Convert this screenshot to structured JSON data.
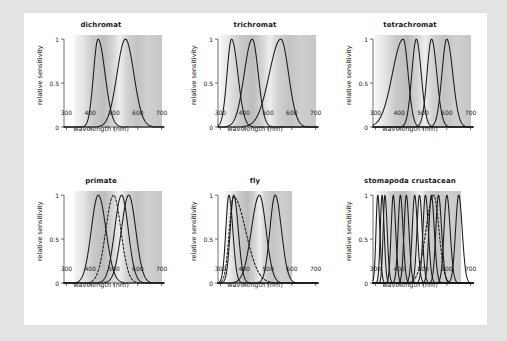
{
  "figure": {
    "background_color": "#e3e3e3",
    "page_color": "#ffffff",
    "axis_label_x": "wavelength (nm)",
    "axis_label_y": "relative sensitivity",
    "x_ticks": [
      "300",
      "400",
      "500",
      "600",
      "700"
    ],
    "y_ticks": [
      "0",
      "0.5",
      "1"
    ]
  },
  "chart_data": [
    {
      "type": "line",
      "title": "dichromat",
      "xlabel": "wavelength (nm)",
      "ylabel": "relative sensitivity",
      "xlim": [
        290,
        710
      ],
      "ylim": [
        0,
        1.05
      ],
      "xticks": [
        300,
        400,
        500,
        600,
        700
      ],
      "yticks": [
        0,
        0.5,
        1
      ],
      "grid": false,
      "legend": "none",
      "spectrum_start_nm": 330,
      "spectrum_end_nm": 700,
      "series": [
        {
          "name": "S-cone",
          "peak_nm": 433,
          "width_left_nm": 26,
          "width_right_nm": 40,
          "values_note": "gaussian peak 1.0",
          "dashed": false
        },
        {
          "name": "L-cone",
          "peak_nm": 548,
          "width_left_nm": 48,
          "width_right_nm": 48,
          "values_note": "gaussian peak 1.0",
          "dashed": false
        }
      ]
    },
    {
      "type": "line",
      "title": "trichromat",
      "xlabel": "wavelength (nm)",
      "ylabel": "relative sensitivity",
      "xlim": [
        290,
        710
      ],
      "ylim": [
        0,
        1.05
      ],
      "xticks": [
        300,
        400,
        500,
        600,
        700
      ],
      "yticks": [
        0,
        0.5,
        1
      ],
      "grid": false,
      "legend": "none",
      "spectrum_start_nm": 300,
      "spectrum_end_nm": 700,
      "series": [
        {
          "name": "UV",
          "peak_nm": 347,
          "width_left_nm": 26,
          "width_right_nm": 36,
          "dashed": false
        },
        {
          "name": "S",
          "peak_nm": 434,
          "width_left_nm": 46,
          "width_right_nm": 34,
          "dashed": false
        },
        {
          "name": "L",
          "peak_nm": 554,
          "width_left_nm": 66,
          "width_right_nm": 44,
          "dashed": false
        }
      ]
    },
    {
      "type": "line",
      "title": "tetrachromat",
      "xlabel": "wavelength (nm)",
      "ylabel": "relative sensitivity",
      "xlim": [
        290,
        710
      ],
      "ylim": [
        0,
        1.05
      ],
      "xticks": [
        300,
        400,
        500,
        600,
        700
      ],
      "yticks": [
        0,
        0.5,
        1
      ],
      "grid": false,
      "legend": "none",
      "spectrum_start_nm": 300,
      "spectrum_end_nm": 700,
      "series": [
        {
          "name": "P1",
          "peak_nm": 417,
          "width_left_nm": 62,
          "width_right_nm": 28,
          "dashed": false
        },
        {
          "name": "P2",
          "peak_nm": 472,
          "width_left_nm": 26,
          "width_right_nm": 28,
          "dashed": false
        },
        {
          "name": "P3",
          "peak_nm": 536,
          "width_left_nm": 26,
          "width_right_nm": 30,
          "dashed": false
        },
        {
          "name": "P4",
          "peak_nm": 600,
          "width_left_nm": 28,
          "width_right_nm": 34,
          "dashed": false
        }
      ]
    },
    {
      "type": "line",
      "title": "primate",
      "xlabel": "wavelength (nm)",
      "ylabel": "relative sensitivity",
      "xlim": [
        290,
        710
      ],
      "ylim": [
        0,
        1.05
      ],
      "xticks": [
        300,
        400,
        500,
        600,
        700
      ],
      "yticks": [
        0,
        0.5,
        1
      ],
      "grid": false,
      "legend": "none",
      "spectrum_start_nm": 330,
      "spectrum_end_nm": 700,
      "series": [
        {
          "name": "S-cone",
          "peak_nm": 434,
          "width_left_nm": 40,
          "width_right_nm": 44,
          "dashed": false
        },
        {
          "name": "rod",
          "peak_nm": 498,
          "width_left_nm": 44,
          "width_right_nm": 42,
          "dashed": true
        },
        {
          "name": "M-cone",
          "peak_nm": 532,
          "width_left_nm": 40,
          "width_right_nm": 38,
          "dashed": false
        },
        {
          "name": "L-cone",
          "peak_nm": 562,
          "width_left_nm": 42,
          "width_right_nm": 40,
          "dashed": false
        }
      ]
    },
    {
      "type": "line",
      "title": "fly",
      "xlabel": "wavelength (nm)",
      "ylabel": "relative sensitivity",
      "xlim": [
        290,
        710
      ],
      "ylim": [
        0,
        1.05
      ],
      "xticks": [
        300,
        400,
        500,
        600,
        700
      ],
      "yticks": [
        0,
        0.5,
        1
      ],
      "grid": false,
      "legend": "none",
      "spectrum_start_nm": 320,
      "spectrum_end_nm": 600,
      "series": [
        {
          "name": "R7y",
          "peak_nm": 336,
          "width_left_nm": 18,
          "width_right_nm": 22,
          "dashed": false
        },
        {
          "name": "R7p",
          "peak_nm": 356,
          "width_left_nm": 20,
          "width_right_nm": 26,
          "dashed": false
        },
        {
          "name": "R8p",
          "peak_nm": 355,
          "width_left_nm": 24,
          "width_right_nm": 70,
          "peak_value": 0.98,
          "dashed": true
        },
        {
          "name": "R1-6",
          "peak_nm": 464,
          "width_left_nm": 46,
          "width_right_nm": 38,
          "dashed": false
        },
        {
          "name": "R8y",
          "peak_nm": 530,
          "width_left_nm": 30,
          "width_right_nm": 36,
          "dashed": false
        }
      ]
    },
    {
      "type": "line",
      "title": "stomapoda crustacean",
      "xlabel": "wavelength (nm)",
      "ylabel": "relative sensitivity",
      "xlim": [
        290,
        710
      ],
      "ylim": [
        0,
        1.05
      ],
      "xticks": [
        300,
        400,
        500,
        600,
        700
      ],
      "yticks": [
        0,
        0.5,
        1
      ],
      "grid": false,
      "legend": "none",
      "spectrum_start_nm": 300,
      "spectrum_end_nm": 660,
      "series": [
        {
          "name": "R1",
          "peak_nm": 310,
          "width_left_nm": 10,
          "width_right_nm": 12,
          "dashed": false
        },
        {
          "name": "R2",
          "peak_nm": 328,
          "width_left_nm": 10,
          "width_right_nm": 12,
          "dashed": false
        },
        {
          "name": "R3",
          "peak_nm": 340,
          "width_left_nm": 10,
          "width_right_nm": 13,
          "dashed": false
        },
        {
          "name": "R4",
          "peak_nm": 375,
          "width_left_nm": 12,
          "width_right_nm": 14,
          "dashed": false
        },
        {
          "name": "R5",
          "peak_nm": 405,
          "width_left_nm": 13,
          "width_right_nm": 15,
          "dashed": false
        },
        {
          "name": "R6",
          "peak_nm": 430,
          "width_left_nm": 13,
          "width_right_nm": 15,
          "dashed": false
        },
        {
          "name": "R7",
          "peak_nm": 465,
          "width_left_nm": 14,
          "width_right_nm": 16,
          "dashed": false
        },
        {
          "name": "R8",
          "peak_nm": 485,
          "width_left_nm": 14,
          "width_right_nm": 16,
          "dashed": false
        },
        {
          "name": "R9",
          "peak_nm": 510,
          "width_left_nm": 14,
          "width_right_nm": 17,
          "dashed": false
        },
        {
          "name": "rod",
          "peak_nm": 545,
          "width_left_nm": 44,
          "width_right_nm": 30,
          "dashed": true
        },
        {
          "name": "R10",
          "peak_nm": 535,
          "width_left_nm": 14,
          "width_right_nm": 17,
          "dashed": false
        },
        {
          "name": "R11",
          "peak_nm": 565,
          "width_left_nm": 15,
          "width_right_nm": 18,
          "dashed": false
        },
        {
          "name": "R12",
          "peak_nm": 600,
          "width_left_nm": 16,
          "width_right_nm": 19,
          "dashed": false
        },
        {
          "name": "R13",
          "peak_nm": 650,
          "width_left_nm": 18,
          "width_right_nm": 20,
          "dashed": false
        }
      ]
    }
  ]
}
